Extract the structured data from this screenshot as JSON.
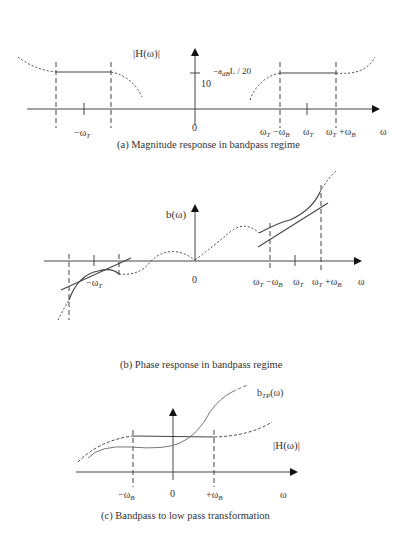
{
  "panels": {
    "a": {
      "caption": "(a) Magnitude response in bandpass regime",
      "y_label": "|H(ω)|",
      "level_base": "10",
      "level_exp_prefix": "−a",
      "level_exp_sub": "dB",
      "level_exp_suffix": "L / 20",
      "x_labels": {
        "neg_center": "−ω",
        "neg_center_sub": "T",
        "zero": "0",
        "lower_edge": "ω",
        "lower_edge_sub": "T",
        "lower_edge_mid": " −ω",
        "lower_edge_sub2": "B",
        "center": "ω",
        "center_sub": "T",
        "upper_edge": "ω",
        "upper_edge_sub": "T",
        "upper_edge_mid": " +ω",
        "upper_edge_sub2": "B",
        "axis": "ω"
      }
    },
    "b": {
      "caption": "(b) Phase response in bandpass regime",
      "y_label": "b(ω)",
      "x_labels": {
        "neg_center": "−ω",
        "neg_center_sub": "T",
        "zero": "0",
        "lower_edge": "ω",
        "lower_edge_sub": "T",
        "lower_edge_mid": " −ω",
        "lower_edge_sub2": "B",
        "center": "ω",
        "center_sub": "T",
        "upper_edge": "ω",
        "upper_edge_sub": "T",
        "upper_edge_mid": " +ω",
        "upper_edge_sub2": "B",
        "axis": "ω"
      }
    },
    "c": {
      "caption": "(c) Bandpass to low pass transformation",
      "phase_label": "b",
      "phase_label_sub": "TP",
      "phase_label_suffix": "(ω)",
      "mag_label": "|H(ω)|",
      "x_labels": {
        "neg_edge": "−ω",
        "neg_edge_sub": "B",
        "zero": "0",
        "pos_edge": "+ω",
        "pos_edge_sub": "B",
        "axis": "ω"
      }
    }
  }
}
